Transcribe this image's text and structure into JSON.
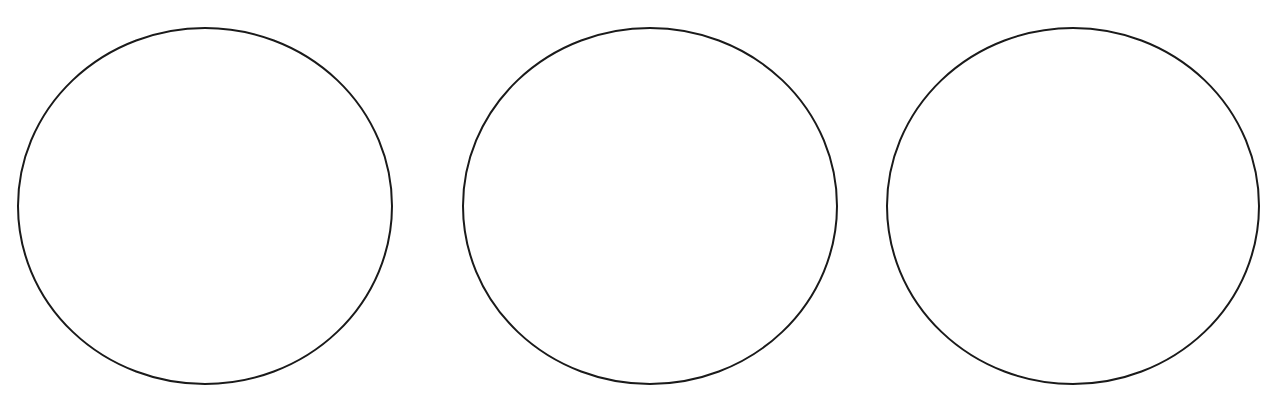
{
  "figure": {
    "stroke_color": "#1a1a1a",
    "fill_color": "#ffffff",
    "background_color": "#ffffff",
    "circles": [
      {
        "id": "circle-1",
        "cx": 205,
        "cy": 206,
        "rx": 187,
        "ry": 178
      },
      {
        "id": "circle-2",
        "cx": 650,
        "cy": 206,
        "rx": 187,
        "ry": 178
      },
      {
        "id": "circle-3",
        "cx": 1073,
        "cy": 206,
        "rx": 186,
        "ry": 178
      }
    ]
  },
  "background_text": {
    "note": "Faint bleed-through text from reverse side of scanned page; illegible",
    "heading_1": "",
    "heading_2": ""
  }
}
